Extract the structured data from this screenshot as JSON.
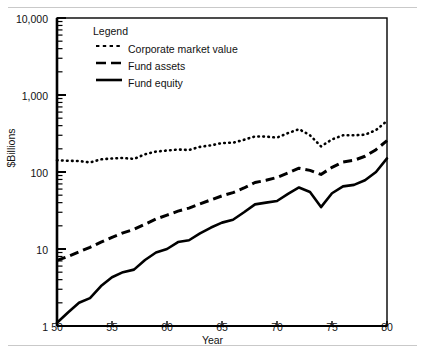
{
  "chart_data": {
    "type": "line",
    "title": "",
    "xlabel": "Year",
    "ylabel": "$Billions",
    "yscale": "log",
    "ylim": [
      1,
      10000
    ],
    "xlim": [
      50,
      80
    ],
    "grid": false,
    "legend_position": "upper-left-inside",
    "legend_title": "Legend",
    "ytick_labels": [
      "10,000",
      "1,000",
      "100",
      "10",
      "1"
    ],
    "ytick_values": [
      10000,
      1000,
      100,
      10,
      1
    ],
    "xtick_labels": [
      "50",
      "55",
      "60",
      "65",
      "70",
      "75",
      "80"
    ],
    "xtick_values": [
      50,
      55,
      60,
      65,
      70,
      75,
      80
    ],
    "x": [
      50,
      51,
      52,
      53,
      54,
      55,
      56,
      57,
      58,
      59,
      60,
      61,
      62,
      63,
      64,
      65,
      66,
      67,
      68,
      69,
      70,
      71,
      72,
      73,
      74,
      75,
      76,
      77,
      78,
      79,
      80
    ],
    "series": [
      {
        "name": "Corporate market value",
        "style": "dotted",
        "color": "#000000",
        "values": [
          142,
          140,
          139,
          133,
          146,
          150,
          152,
          148,
          170,
          184,
          190,
          196,
          193,
          212,
          222,
          238,
          240,
          262,
          290,
          288,
          280,
          320,
          360,
          300,
          215,
          265,
          300,
          300,
          305,
          350,
          460
        ]
      },
      {
        "name": "Fund assets",
        "style": "dashed",
        "color": "#000000",
        "values": [
          7.1,
          8.0,
          9.2,
          10.5,
          12.3,
          14.2,
          16.2,
          18.0,
          21.0,
          24.5,
          27.5,
          31.0,
          34.0,
          38.5,
          43.5,
          49.0,
          54.0,
          62.0,
          73.0,
          78.0,
          85.0,
          97.0,
          112.0,
          105.0,
          93.0,
          115.0,
          135.0,
          142.0,
          160.0,
          195.0,
          255.0
        ]
      },
      {
        "name": "Fund equity",
        "style": "solid",
        "color": "#000000",
        "values": [
          1.1,
          1.5,
          2.0,
          2.3,
          3.3,
          4.3,
          5.0,
          5.4,
          7.2,
          9.0,
          10.0,
          12.3,
          13.0,
          16.0,
          19.0,
          22.0,
          24.0,
          30.0,
          38.0,
          40.0,
          42.0,
          52.0,
          63.0,
          55.0,
          35.0,
          53.0,
          65.0,
          68.0,
          78.0,
          100.0,
          150.0
        ]
      }
    ]
  },
  "axes": {
    "y_label": "$Billions",
    "x_label": "Year"
  },
  "legend": {
    "title": "Legend",
    "entries": [
      {
        "label": "Corporate market value",
        "style": "dotted"
      },
      {
        "label": "Fund assets",
        "style": "dashed"
      },
      {
        "label": "Fund equity",
        "style": "solid"
      }
    ]
  }
}
